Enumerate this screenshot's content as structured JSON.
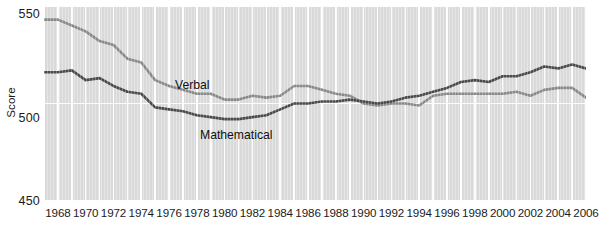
{
  "chart_data": {
    "type": "line",
    "title": "",
    "xlabel": "",
    "ylabel": "Score",
    "xlim": [
      1967,
      2006
    ],
    "ylim": [
      450,
      550
    ],
    "yticks": [
      450,
      500,
      550
    ],
    "xticks": [
      1968,
      1970,
      1972,
      1974,
      1976,
      1978,
      1980,
      1982,
      1984,
      1986,
      1988,
      1990,
      1992,
      1994,
      1996,
      1998,
      2000,
      2002,
      2004,
      2006
    ],
    "grid": "vertical-yearly-and-horizontal-at-yticks",
    "legend_position": "inline-labels",
    "x": [
      1967,
      1968,
      1969,
      1970,
      1971,
      1972,
      1973,
      1974,
      1975,
      1976,
      1977,
      1978,
      1979,
      1980,
      1981,
      1982,
      1983,
      1984,
      1985,
      1986,
      1987,
      1988,
      1989,
      1990,
      1991,
      1992,
      1993,
      1994,
      1995,
      1996,
      1997,
      1998,
      1999,
      2000,
      2001,
      2002,
      2003,
      2004,
      2005,
      2006
    ],
    "series": [
      {
        "name": "Verbal",
        "color": "#8a8a8a",
        "values": [
          543,
          543,
          540,
          537,
          532,
          530,
          523,
          521,
          512,
          509,
          507,
          505,
          505,
          502,
          502,
          504,
          503,
          504,
          509,
          509,
          507,
          505,
          504,
          500,
          499,
          500,
          500,
          499,
          504,
          505,
          505,
          505,
          505,
          505,
          506,
          504,
          507,
          508,
          508,
          503
        ]
      },
      {
        "name": "Mathematical",
        "color": "#4a4a4a",
        "values": [
          516,
          516,
          517,
          512,
          513,
          509,
          506,
          505,
          498,
          497,
          496,
          494,
          493,
          492,
          492,
          493,
          494,
          497,
          500,
          500,
          501,
          501,
          502,
          501,
          500,
          501,
          503,
          504,
          506,
          508,
          511,
          512,
          511,
          514,
          514,
          516,
          519,
          518,
          520,
          518
        ]
      }
    ],
    "annotations": [
      {
        "text": "Verbal",
        "x": 1980,
        "y": 516
      },
      {
        "text": "Mathematical",
        "x": 1982,
        "y": 489
      }
    ]
  },
  "axis": {
    "y_title": "Score",
    "y_tick_labels": [
      "550",
      "500",
      "450"
    ],
    "x_tick_labels": [
      "1968",
      "1970",
      "1972",
      "1974",
      "1976",
      "1978",
      "1980",
      "1982",
      "1984",
      "1986",
      "1988",
      "1990",
      "1992",
      "1994",
      "1996",
      "1998",
      "2000",
      "2002",
      "2004",
      "2006"
    ]
  },
  "labels": {
    "verbal": "Verbal",
    "mathematical": "Mathematical"
  },
  "colors": {
    "plot_background": "#dcdcdc",
    "gridline": "#ffffff",
    "verbal_line": "#8a8a8a",
    "mathematical_line": "#4a4a4a",
    "text": "#1b1b1b"
  }
}
